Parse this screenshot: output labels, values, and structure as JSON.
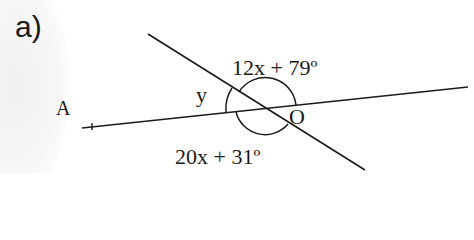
{
  "part_label": "a)",
  "diagram": {
    "angle_upper_label": "12x + 79º",
    "angle_lower_label": "20x + 31º",
    "angle_left_label": "y",
    "intersection_label": "O",
    "point_label": "A",
    "lines": [
      {
        "name": "line-through-A",
        "from": [
          82,
          128
        ],
        "to": [
          468,
          87
        ]
      },
      {
        "name": "transversal",
        "from": [
          148,
          34
        ],
        "to": [
          365,
          170
        ]
      }
    ],
    "intersection_point": [
      265,
      108
    ],
    "colors": {
      "stroke": "#1a1a1a",
      "background": "#ffffff"
    }
  }
}
